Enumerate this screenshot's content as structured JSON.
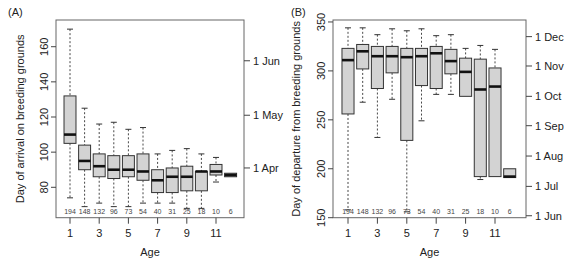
{
  "chart_data": [
    {
      "type": "box",
      "panel": "(A)",
      "title": "",
      "xlabel": "Age",
      "ylabel": "Day of arrival on breeding grounds",
      "ylim": [
        62.7,
        175.2
      ],
      "y_ticks": [
        80,
        100,
        120,
        140,
        160
      ],
      "x_ticks": [
        1,
        3,
        5,
        7,
        9,
        11
      ],
      "right_axis": [
        {
          "label": "1 Apr",
          "value": 91
        },
        {
          "label": "1 May",
          "value": 121
        },
        {
          "label": "1 Jun",
          "value": 152
        }
      ],
      "categories": [
        1,
        2,
        3,
        4,
        5,
        6,
        7,
        8,
        9,
        10,
        11,
        12
      ],
      "n": [
        "194",
        "148",
        "132",
        "96",
        "73",
        "54",
        "40",
        "31",
        "25",
        "18",
        "10",
        "6"
      ],
      "boxes": [
        {
          "age": 1,
          "lo": 74,
          "q1": 105,
          "med": 110,
          "q3": 132,
          "hi": 170
        },
        {
          "age": 2,
          "lo": 69,
          "q1": 90,
          "med": 95,
          "q3": 104,
          "hi": 125
        },
        {
          "age": 3,
          "lo": 71,
          "q1": 86,
          "med": 92,
          "q3": 99,
          "hi": 116
        },
        {
          "age": 4,
          "lo": 69,
          "q1": 85,
          "med": 90,
          "q3": 98,
          "hi": 117
        },
        {
          "age": 5,
          "lo": 69,
          "q1": 86,
          "med": 90,
          "q3": 98,
          "hi": 113
        },
        {
          "age": 6,
          "lo": 71,
          "q1": 84,
          "med": 89,
          "q3": 99,
          "hi": 114
        },
        {
          "age": 7,
          "lo": 71,
          "q1": 77,
          "med": 84,
          "q3": 90,
          "hi": 99
        },
        {
          "age": 8,
          "lo": 71,
          "q1": 77,
          "med": 86,
          "q3": 91,
          "hi": 101
        },
        {
          "age": 9,
          "lo": 68,
          "q1": 78,
          "med": 86,
          "q3": 92,
          "hi": 102
        },
        {
          "age": 10,
          "lo": 68,
          "q1": 78,
          "med": 89,
          "q3": 89,
          "hi": 99
        },
        {
          "age": 11,
          "lo": 83,
          "q1": 87,
          "med": 89,
          "q3": 93,
          "hi": 97
        },
        {
          "age": 12,
          "lo": 86,
          "q1": 86,
          "med": 87,
          "q3": 88,
          "hi": 88
        }
      ],
      "grid": false
    },
    {
      "type": "box",
      "panel": "(B)",
      "title": "",
      "xlabel": "Age",
      "ylabel": "Day of departure from breeding grounds",
      "ylim": [
        150,
        352
      ],
      "y_ticks": [
        150,
        200,
        250,
        300,
        350
      ],
      "x_ticks": [
        1,
        3,
        5,
        7,
        9,
        11
      ],
      "right_axis": [
        {
          "label": "1 Jun",
          "value": 152
        },
        {
          "label": "1 Jul",
          "value": 182
        },
        {
          "label": "1 Aug",
          "value": 213
        },
        {
          "label": "1 Sep",
          "value": 244
        },
        {
          "label": "1 Oct",
          "value": 274
        },
        {
          "label": "1 Nov",
          "value": 305
        },
        {
          "label": "1 Dec",
          "value": 335
        }
      ],
      "categories": [
        1,
        2,
        3,
        4,
        5,
        6,
        7,
        8,
        9,
        10,
        11,
        12
      ],
      "n": [
        "194",
        "148",
        "132",
        "96",
        "73",
        "54",
        "40",
        "31",
        "25",
        "18",
        "10",
        "6"
      ],
      "boxes": [
        {
          "age": 1,
          "lo": 158,
          "q1": 256,
          "med": 311,
          "q3": 323,
          "hi": 344
        },
        {
          "age": 2,
          "lo": 268,
          "q1": 302,
          "med": 320,
          "q3": 327,
          "hi": 344
        },
        {
          "age": 3,
          "lo": 232,
          "q1": 282,
          "med": 315,
          "q3": 325,
          "hi": 337
        },
        {
          "age": 4,
          "lo": 271,
          "q1": 298,
          "med": 315,
          "q3": 325,
          "hi": 343
        },
        {
          "age": 5,
          "lo": 156,
          "q1": 229,
          "med": 314,
          "q3": 323,
          "hi": 341
        },
        {
          "age": 6,
          "lo": 249,
          "q1": 285,
          "med": 315,
          "q3": 323,
          "hi": 343
        },
        {
          "age": 7,
          "lo": 276,
          "q1": 282,
          "med": 318,
          "q3": 325,
          "hi": 336
        },
        {
          "age": 8,
          "lo": 276,
          "q1": 297,
          "med": 310,
          "q3": 322,
          "hi": 337
        },
        {
          "age": 9,
          "lo": 274,
          "q1": 274,
          "med": 299,
          "q3": 313,
          "hi": 323
        },
        {
          "age": 10,
          "lo": 189,
          "q1": 192,
          "med": 281,
          "q3": 312,
          "hi": 326
        },
        {
          "age": 11,
          "lo": 192,
          "q1": 192,
          "med": 284,
          "q3": 303,
          "hi": 322
        },
        {
          "age": 12,
          "lo": 191,
          "q1": 191,
          "med": 192,
          "q3": 200,
          "hi": 200
        }
      ],
      "grid": false
    }
  ],
  "layout": {
    "panels": [
      {
        "left": 56,
        "right": 244,
        "top": 20,
        "bottom": 217.7,
        "x0": 70,
        "dx": 14.6,
        "label_x": 8,
        "ylabel_x": 24
      },
      {
        "left": 333,
        "right": 526,
        "top": 20,
        "bottom": 217.7,
        "x0": 348,
        "dx": 14.7,
        "label_x": 291,
        "ylabel_x": 300
      }
    ]
  }
}
